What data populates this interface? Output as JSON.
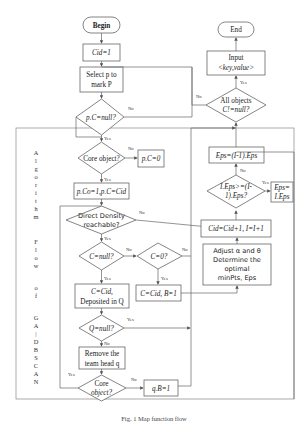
{
  "diagram": {
    "vertical_label": [
      "A",
      "l",
      "g",
      "o",
      "r",
      "i",
      "t",
      "h",
      "m",
      " ",
      "F",
      "l",
      "o",
      "w",
      " ",
      "o",
      "f",
      " ",
      "G",
      "A",
      "|",
      "D",
      "B",
      "S",
      "C",
      "A",
      "N"
    ],
    "caption": "Fig. 1   Map function flow",
    "nodes": {
      "begin": "Begin",
      "cid_init": "Cid=1",
      "select_p_1": "Select p to",
      "select_p_2": "mark P",
      "pc_null": "p.C=null?",
      "core_object": "Core object?",
      "pc_zero": "p.C=0",
      "pco_assign": "p.Co=1,p.C=Cid",
      "direct_density_1": "Direct Density",
      "direct_density_2": "reachable?",
      "c_null": "C=null?",
      "c_zero": "C=0?",
      "c_cid_1": "C=Cid,",
      "c_cid_2": "Deposited in Q",
      "c_cid_b": "C=Cid, B=1",
      "q_null": "Q=null?",
      "remove_1": "Remove the",
      "remove_2": "team head q",
      "core_object2_1": "Core",
      "core_object2_2": "object?",
      "qb_one": "q.B=1",
      "adjust_1": "Adjust α and θ",
      "adjust_2": "Determine the",
      "adjust_3": "optimal",
      "adjust_4": "minPts, Eps",
      "cid_inc": "Cid=Cid+1, I=I+1",
      "eps_cmp_1": "I.Eps>=(I-",
      "eps_cmp_2": "1).Eps?",
      "eps_set_1": "Eps=",
      "eps_set_2": "I.Eps",
      "eps_prev": "Eps=(I-1).Eps",
      "all_objects_1": "All objects",
      "all_objects_2": "C!=null?",
      "input_1": "Input",
      "input_2": "<key,value>",
      "end": "End"
    },
    "edge_labels": {
      "yes": "Yes",
      "no": "No"
    }
  }
}
